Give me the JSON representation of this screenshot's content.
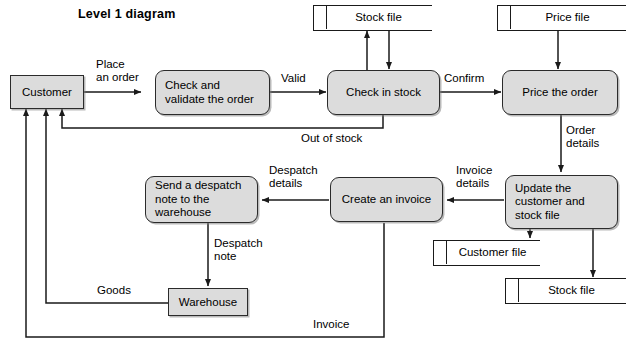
{
  "diagram": {
    "title": "Level 1 diagram",
    "type": "data-flow-diagram",
    "colors": {
      "shape_fill": "#dcdcdc",
      "stroke": "#2b2b2b",
      "background": "#ffffff"
    }
  },
  "processes": [
    {
      "id": "p_check_validate",
      "label": "Check and\nvalidate the order"
    },
    {
      "id": "p_check_stock",
      "label": "Check in stock"
    },
    {
      "id": "p_price_order",
      "label": "Price the order"
    },
    {
      "id": "p_update_files",
      "label": "Update the\ncustomer and\nstock file"
    },
    {
      "id": "p_create_invoice",
      "label": "Create an invoice"
    },
    {
      "id": "p_send_despatch",
      "label": "Send a despatch\nnote to the\nwarehouse"
    }
  ],
  "entities": [
    {
      "id": "e_customer",
      "label": "Customer"
    },
    {
      "id": "e_warehouse",
      "label": "Warehouse"
    }
  ],
  "data_stores": [
    {
      "id": "d_stock_top",
      "label": "Stock file"
    },
    {
      "id": "d_price",
      "label": "Price file"
    },
    {
      "id": "d_customer_file",
      "label": "Customer file"
    },
    {
      "id": "d_stock_bottom",
      "label": "Stock file"
    }
  ],
  "flows": [
    {
      "id": "f_place_order",
      "label": "Place\nan order",
      "from": "e_customer",
      "to": "p_check_validate"
    },
    {
      "id": "f_valid",
      "label": "Valid",
      "from": "p_check_validate",
      "to": "p_check_stock"
    },
    {
      "id": "f_confirm",
      "label": "Confirm",
      "from": "p_check_stock",
      "to": "p_price_order"
    },
    {
      "id": "f_out_of_stock",
      "label": "Out of stock",
      "from": "p_check_stock",
      "to": "e_customer"
    },
    {
      "id": "f_order_details",
      "label": "Order\ndetails",
      "from": "p_price_order",
      "to": "p_update_files"
    },
    {
      "id": "f_invoice_details",
      "label": "Invoice\ndetails",
      "from": "p_update_files",
      "to": "p_create_invoice"
    },
    {
      "id": "f_despatch_det",
      "label": "Despatch\ndetails",
      "from": "p_create_invoice",
      "to": "p_send_despatch"
    },
    {
      "id": "f_despatch_note",
      "label": "Despatch\nnote",
      "from": "p_send_despatch",
      "to": "e_warehouse"
    },
    {
      "id": "f_goods",
      "label": "Goods",
      "from": "e_warehouse",
      "to": "e_customer"
    },
    {
      "id": "f_invoice",
      "label": "Invoice",
      "from": "p_create_invoice",
      "to": "e_customer"
    },
    {
      "id": "f_stock_read",
      "label": "",
      "from": "p_check_stock",
      "to": "d_stock_top"
    },
    {
      "id": "f_stock_write",
      "label": "",
      "from": "d_stock_top",
      "to": "p_check_stock"
    },
    {
      "id": "f_price_read",
      "label": "",
      "from": "d_price",
      "to": "p_price_order"
    },
    {
      "id": "f_cust_write",
      "label": "",
      "from": "p_update_files",
      "to": "d_customer_file"
    },
    {
      "id": "f_stock_write2",
      "label": "",
      "from": "p_update_files",
      "to": "d_stock_bottom"
    }
  ]
}
